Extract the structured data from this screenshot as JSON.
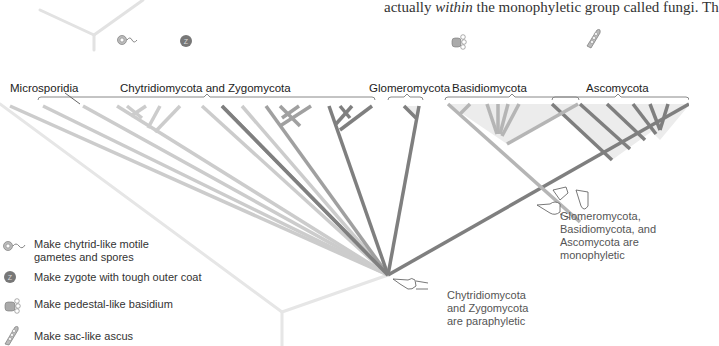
{
  "body_text": {
    "prefix": "actually ",
    "emphasis": "within",
    "suffix": " the monophyletic group called fungi. Th"
  },
  "clades": [
    {
      "name": "Microsporidia",
      "x": 10,
      "y": 82
    },
    {
      "name": "Chytridiomycota and Zygomycota",
      "x": 120,
      "y": 82
    },
    {
      "name": "Glomeromycota",
      "x": 385,
      "y": 82
    },
    {
      "name": "Basidiomycota",
      "x": 458,
      "y": 82
    },
    {
      "name": "Ascomycota",
      "x": 580,
      "y": 82
    }
  ],
  "annotations": {
    "monophyletic": [
      "Glomeromycota,",
      "Basidiomycota, and",
      "Ascomycota are",
      "monophyletic"
    ],
    "paraphyletic": [
      "Chytridiomycota",
      "and Zygomycota",
      "are paraphyletic"
    ]
  },
  "legend": [
    {
      "icon": "motile-spore-icon",
      "text_lines": [
        "Make chytrid-like motile",
        "gametes and spores"
      ]
    },
    {
      "icon": "zygote-icon",
      "text_lines": [
        "Make zygote with tough outer coat"
      ]
    },
    {
      "icon": "basidium-icon",
      "text_lines": [
        "Make pedestal-like basidium"
      ]
    },
    {
      "icon": "ascus-icon",
      "text_lines": [
        "Make sac-like ascus"
      ]
    }
  ],
  "colors": {
    "light_branch": "#c8c8c8",
    "mid_branch": "#a9a9a9",
    "dark_branch": "#7f7f7f",
    "basidio_branch": "#b5b5b5",
    "clade_fill": "#ececec",
    "bracket": "#888888"
  }
}
